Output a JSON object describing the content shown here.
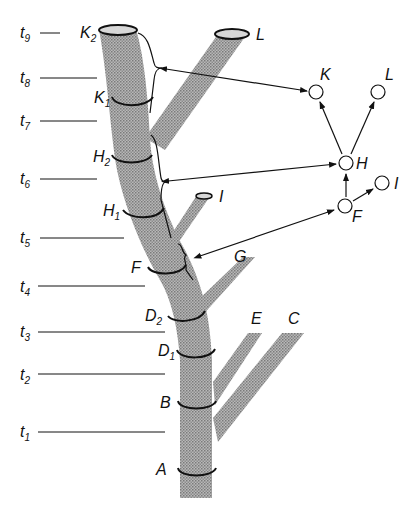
{
  "time_axis": {
    "ticks": [
      {
        "label": "t",
        "sub": "9",
        "y": 33,
        "x2": 48
      },
      {
        "label": "t",
        "sub": "8",
        "y": 78,
        "x2": 96
      },
      {
        "label": "t",
        "sub": "7",
        "y": 121,
        "x2": 96
      },
      {
        "label": "t",
        "sub": "6",
        "y": 179,
        "x2": 96
      },
      {
        "label": "t",
        "sub": "5",
        "y": 238,
        "x2": 122
      },
      {
        "label": "t",
        "sub": "4",
        "y": 287,
        "x2": 145
      },
      {
        "label": "t",
        "sub": "3",
        "y": 332,
        "x2": 164
      },
      {
        "label": "t",
        "sub": "2",
        "y": 374,
        "x2": 164
      },
      {
        "label": "t",
        "sub": "1",
        "y": 432,
        "x2": 164
      }
    ]
  },
  "tree_labels": {
    "K2": {
      "main": "K",
      "sub": "2"
    },
    "K1": {
      "main": "K",
      "sub": "1"
    },
    "H2": {
      "main": "H",
      "sub": "2"
    },
    "H1": {
      "main": "H",
      "sub": "1"
    },
    "F": {
      "main": "F"
    },
    "D2": {
      "main": "D",
      "sub": "2"
    },
    "D1": {
      "main": "D",
      "sub": "1"
    },
    "B": {
      "main": "B"
    },
    "A": {
      "main": "A"
    },
    "L": {
      "main": "L"
    },
    "I": {
      "main": "I"
    },
    "G": {
      "main": "G"
    },
    "E": {
      "main": "E"
    },
    "C": {
      "main": "C"
    }
  },
  "graph": {
    "nodes": [
      {
        "id": "K",
        "label": "K",
        "x": 316,
        "y": 92
      },
      {
        "id": "L",
        "label": "L",
        "x": 378,
        "y": 92
      },
      {
        "id": "H",
        "label": "H",
        "x": 346,
        "y": 163
      },
      {
        "id": "I",
        "label": "I",
        "x": 381,
        "y": 183
      },
      {
        "id": "F",
        "label": "F",
        "x": 345,
        "y": 206
      }
    ],
    "edges": [
      {
        "from": "H",
        "to": "K"
      },
      {
        "from": "H",
        "to": "L"
      },
      {
        "from": "F",
        "to": "H"
      },
      {
        "from": "F",
        "to": "I"
      }
    ]
  },
  "colors": {
    "trunk_fill": "#9a9a9a",
    "line": "#111111",
    "background": "#ffffff"
  }
}
